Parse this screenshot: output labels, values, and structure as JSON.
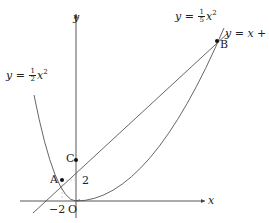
{
  "diagram": {
    "axes": {
      "x_label": "x",
      "y_label": "y",
      "origin_label": "O"
    },
    "curves": [
      {
        "name": "parabola-left",
        "label_prefix": "y = ",
        "coef_num": "1",
        "coef_den": "2",
        "var": "x",
        "power": "2"
      },
      {
        "name": "parabola-right",
        "label_prefix": "y = ",
        "coef_num": "1",
        "coef_den": "5",
        "var": "x",
        "power": "2"
      },
      {
        "name": "line",
        "label": "y = x + 4"
      }
    ],
    "points": [
      {
        "name": "A",
        "label": "A"
      },
      {
        "name": "B",
        "label": "B"
      },
      {
        "name": "C",
        "label": "C"
      }
    ],
    "ticks": {
      "x_tick": "−2",
      "y_tick": "2"
    },
    "colors": {
      "curve": "#555555",
      "axis": "#444444",
      "point": "#111111",
      "guide": "#bbbbbb"
    }
  }
}
